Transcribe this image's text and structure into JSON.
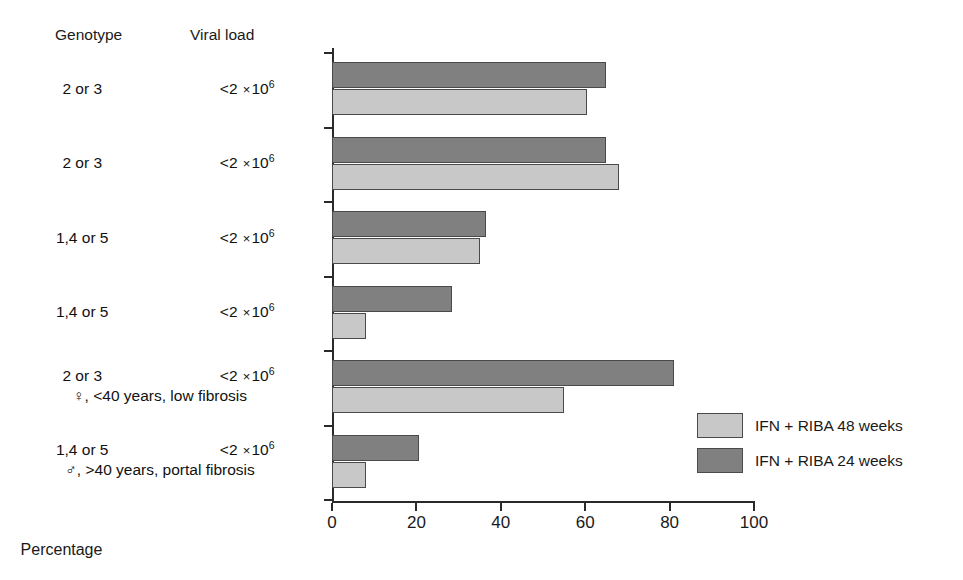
{
  "headers": {
    "genotype": "Genotype",
    "viral_load": "Viral load"
  },
  "axis": {
    "x_title": "Percentage",
    "x_ticks": [
      0,
      20,
      40,
      60,
      80,
      100
    ],
    "x_min": 0,
    "x_max": 100
  },
  "legend": {
    "position": "right-middle",
    "entries": [
      {
        "label": "IFN + RIBA 48 weeks",
        "color": "#c8c8c8",
        "series": "48w"
      },
      {
        "label": "IFN + RIBA 24 weeks",
        "color": "#808080",
        "series": "24w"
      }
    ]
  },
  "chart_data": {
    "type": "bar",
    "orientation": "horizontal",
    "title": "",
    "xlabel": "Percentage",
    "ylabel": "",
    "xlim": [
      0,
      100
    ],
    "grid": false,
    "legend_position": "right-middle",
    "categories": [
      "2 or 3 / <2 ×10⁶",
      "2 or 3 / <2 ×10⁶",
      "1,4 or 5 / <2 ×10⁶",
      "1,4 or 5 / <2 ×10⁶",
      "2 or 3 / <2 ×10⁶, ♀, <40 years, low fibrosis",
      "1,4 or 5 / <2 ×10⁶, ♂, >40 years, portal fibrosis"
    ],
    "series": [
      {
        "name": "IFN + RIBA 24 weeks",
        "color": "#808080",
        "values": [
          65,
          65,
          36.5,
          28.5,
          81,
          20.5
        ]
      },
      {
        "name": "IFN + RIBA 48 weeks",
        "color": "#c8c8c8",
        "values": [
          60.5,
          68,
          35,
          8,
          55,
          8
        ]
      }
    ]
  },
  "rows": [
    {
      "genotype": "2 or 3",
      "viral_base": "<2 ×10",
      "viral_exp": "6",
      "note": ""
    },
    {
      "genotype": "2 or 3",
      "viral_base": "<2 ×10",
      "viral_exp": "6",
      "note": ""
    },
    {
      "genotype": "1,4 or 5",
      "viral_base": "<2 ×10",
      "viral_exp": "6",
      "note": ""
    },
    {
      "genotype": "1,4 or 5",
      "viral_base": "<2 ×10",
      "viral_exp": "6",
      "note": ""
    },
    {
      "genotype": "2 or 3",
      "viral_base": "<2 ×10",
      "viral_exp": "6",
      "note": "♀, <40 years, low fibrosis"
    },
    {
      "genotype": "1,4 or 5",
      "viral_base": "<2 ×10",
      "viral_exp": "6",
      "note": "♂, >40 years, portal fibrosis"
    }
  ]
}
